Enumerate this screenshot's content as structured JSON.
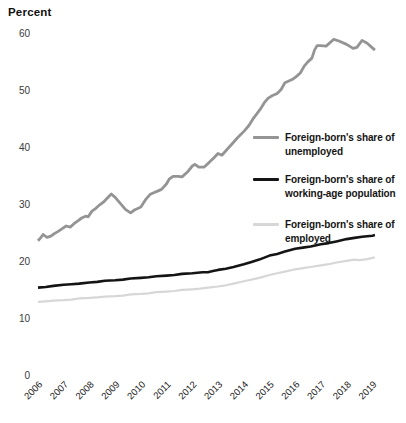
{
  "chart_data": {
    "type": "line",
    "title": "",
    "xlabel": "",
    "ylabel": "Percent",
    "grid": false,
    "legend_position": "right-inside",
    "y_axis": {
      "label": "Percent",
      "ticks": [
        60,
        50,
        40,
        30,
        20,
        10,
        0
      ],
      "range": [
        0,
        62
      ]
    },
    "x_axis": {
      "ticks": [
        2006,
        2007,
        2008,
        2009,
        2010,
        2011,
        2012,
        2013,
        2014,
        2015,
        2016,
        2017,
        2018,
        2019
      ]
    },
    "series": [
      {
        "id": "unemployed-line",
        "name": "Foreign-born's share of unemployed",
        "color": "#949494",
        "width": 2.8,
        "points": [
          [
            2006.0,
            23.6
          ],
          [
            2006.1,
            24.1
          ],
          [
            2006.2,
            24.7
          ],
          [
            2006.35,
            24.2
          ],
          [
            2006.5,
            24.4
          ],
          [
            2006.65,
            24.9
          ],
          [
            2006.8,
            25.3
          ],
          [
            2007.0,
            25.9
          ],
          [
            2007.1,
            26.2
          ],
          [
            2007.25,
            26.0
          ],
          [
            2007.4,
            26.6
          ],
          [
            2007.55,
            27.1
          ],
          [
            2007.7,
            27.6
          ],
          [
            2007.85,
            27.9
          ],
          [
            2007.95,
            27.8
          ],
          [
            2008.1,
            28.8
          ],
          [
            2008.25,
            29.3
          ],
          [
            2008.4,
            29.9
          ],
          [
            2008.55,
            30.4
          ],
          [
            2008.7,
            31.1
          ],
          [
            2008.85,
            31.8
          ],
          [
            2009.0,
            31.2
          ],
          [
            2009.1,
            30.7
          ],
          [
            2009.25,
            29.9
          ],
          [
            2009.4,
            29.1
          ],
          [
            2009.6,
            28.5
          ],
          [
            2009.75,
            29.0
          ],
          [
            2009.9,
            29.3
          ],
          [
            2010.0,
            29.5
          ],
          [
            2010.2,
            30.9
          ],
          [
            2010.35,
            31.7
          ],
          [
            2010.5,
            32.0
          ],
          [
            2010.65,
            32.3
          ],
          [
            2010.8,
            32.6
          ],
          [
            2011.0,
            33.6
          ],
          [
            2011.1,
            34.4
          ],
          [
            2011.25,
            34.9
          ],
          [
            2011.45,
            34.9
          ],
          [
            2011.6,
            34.8
          ],
          [
            2011.8,
            35.6
          ],
          [
            2012.0,
            36.7
          ],
          [
            2012.1,
            37.0
          ],
          [
            2012.25,
            36.5
          ],
          [
            2012.45,
            36.5
          ],
          [
            2012.65,
            37.3
          ],
          [
            2012.85,
            38.2
          ],
          [
            2013.0,
            38.9
          ],
          [
            2013.15,
            38.6
          ],
          [
            2013.35,
            39.6
          ],
          [
            2013.55,
            40.6
          ],
          [
            2013.75,
            41.6
          ],
          [
            2013.9,
            42.3
          ],
          [
            2014.05,
            43.0
          ],
          [
            2014.2,
            43.8
          ],
          [
            2014.35,
            44.9
          ],
          [
            2014.5,
            45.8
          ],
          [
            2014.65,
            46.7
          ],
          [
            2014.8,
            47.8
          ],
          [
            2014.95,
            48.6
          ],
          [
            2015.1,
            49.0
          ],
          [
            2015.3,
            49.4
          ],
          [
            2015.45,
            50.1
          ],
          [
            2015.6,
            51.3
          ],
          [
            2015.75,
            51.6
          ],
          [
            2015.9,
            51.9
          ],
          [
            2016.05,
            52.4
          ],
          [
            2016.2,
            53.0
          ],
          [
            2016.35,
            54.2
          ],
          [
            2016.5,
            55.0
          ],
          [
            2016.65,
            55.6
          ],
          [
            2016.75,
            57.0
          ],
          [
            2016.85,
            57.8
          ],
          [
            2017.0,
            57.8
          ],
          [
            2017.2,
            57.7
          ],
          [
            2017.5,
            58.9
          ],
          [
            2017.7,
            58.6
          ],
          [
            2018.0,
            58.0
          ],
          [
            2018.25,
            57.3
          ],
          [
            2018.4,
            57.5
          ],
          [
            2018.6,
            58.7
          ],
          [
            2018.8,
            58.2
          ],
          [
            2019.0,
            57.4
          ],
          [
            2019.1,
            57.0
          ]
        ]
      },
      {
        "id": "working-age-line",
        "name": "Foreign-born's share of working-age population",
        "color": "#141414",
        "width": 2.6,
        "points": [
          [
            2006.0,
            15.4
          ],
          [
            2006.3,
            15.5
          ],
          [
            2006.6,
            15.7
          ],
          [
            2007.0,
            15.9
          ],
          [
            2007.3,
            16.0
          ],
          [
            2007.6,
            16.1
          ],
          [
            2008.0,
            16.3
          ],
          [
            2008.3,
            16.4
          ],
          [
            2008.6,
            16.6
          ],
          [
            2009.0,
            16.7
          ],
          [
            2009.3,
            16.8
          ],
          [
            2009.6,
            17.0
          ],
          [
            2010.0,
            17.1
          ],
          [
            2010.3,
            17.2
          ],
          [
            2010.6,
            17.4
          ],
          [
            2011.0,
            17.5
          ],
          [
            2011.3,
            17.6
          ],
          [
            2011.6,
            17.8
          ],
          [
            2012.0,
            17.9
          ],
          [
            2012.2,
            18.0
          ],
          [
            2012.4,
            18.1
          ],
          [
            2012.6,
            18.1
          ],
          [
            2012.8,
            18.3
          ],
          [
            2013.0,
            18.5
          ],
          [
            2013.3,
            18.7
          ],
          [
            2013.6,
            19.0
          ],
          [
            2014.0,
            19.5
          ],
          [
            2014.3,
            19.9
          ],
          [
            2014.6,
            20.3
          ],
          [
            2015.0,
            21.0
          ],
          [
            2015.3,
            21.3
          ],
          [
            2015.6,
            21.7
          ],
          [
            2016.0,
            22.2
          ],
          [
            2016.3,
            22.4
          ],
          [
            2016.6,
            22.6
          ],
          [
            2017.0,
            23.0
          ],
          [
            2017.3,
            23.2
          ],
          [
            2017.6,
            23.5
          ],
          [
            2018.0,
            23.9
          ],
          [
            2018.3,
            24.1
          ],
          [
            2018.6,
            24.3
          ],
          [
            2019.0,
            24.5
          ],
          [
            2019.1,
            24.6
          ]
        ]
      },
      {
        "id": "employed-line",
        "name": "Foreign-born's share of employed",
        "color": "#d7d7d7",
        "width": 2.2,
        "points": [
          [
            2006.0,
            12.9
          ],
          [
            2006.3,
            13.0
          ],
          [
            2006.6,
            13.1
          ],
          [
            2007.0,
            13.2
          ],
          [
            2007.3,
            13.3
          ],
          [
            2007.6,
            13.5
          ],
          [
            2008.0,
            13.6
          ],
          [
            2008.3,
            13.7
          ],
          [
            2008.6,
            13.8
          ],
          [
            2009.0,
            13.9
          ],
          [
            2009.3,
            14.0
          ],
          [
            2009.6,
            14.2
          ],
          [
            2010.0,
            14.3
          ],
          [
            2010.3,
            14.4
          ],
          [
            2010.6,
            14.6
          ],
          [
            2011.0,
            14.7
          ],
          [
            2011.3,
            14.8
          ],
          [
            2011.6,
            15.0
          ],
          [
            2012.0,
            15.1
          ],
          [
            2012.3,
            15.2
          ],
          [
            2012.6,
            15.4
          ],
          [
            2013.0,
            15.6
          ],
          [
            2013.3,
            15.8
          ],
          [
            2013.6,
            16.1
          ],
          [
            2014.0,
            16.5
          ],
          [
            2014.3,
            16.8
          ],
          [
            2014.6,
            17.1
          ],
          [
            2015.0,
            17.6
          ],
          [
            2015.3,
            17.9
          ],
          [
            2015.6,
            18.2
          ],
          [
            2016.0,
            18.6
          ],
          [
            2016.3,
            18.8
          ],
          [
            2016.6,
            19.0
          ],
          [
            2017.0,
            19.3
          ],
          [
            2017.3,
            19.5
          ],
          [
            2017.6,
            19.8
          ],
          [
            2018.0,
            20.1
          ],
          [
            2018.3,
            20.3
          ],
          [
            2018.5,
            20.2
          ],
          [
            2018.8,
            20.4
          ],
          [
            2019.0,
            20.6
          ],
          [
            2019.1,
            20.7
          ]
        ]
      }
    ]
  },
  "legend": {
    "items": [
      {
        "line1": "Foreign-born's share of",
        "line2": "unemployed",
        "color": "#949494"
      },
      {
        "line1": "Foreign-born's share of",
        "line2": "working-age population",
        "color": "#141414"
      },
      {
        "line1": "Foreign-born's share of",
        "line2": "employed",
        "color": "#d7d7d7"
      }
    ]
  }
}
